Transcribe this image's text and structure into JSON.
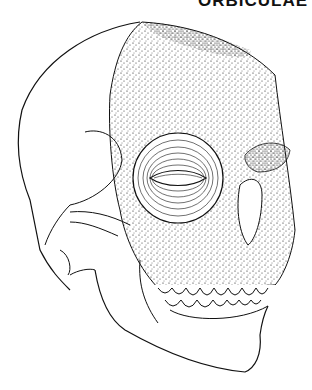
{
  "figure": {
    "heading_text_cropped": "ORBICULAE",
    "ink_color": "#111111",
    "background_color": "#ffffff"
  }
}
